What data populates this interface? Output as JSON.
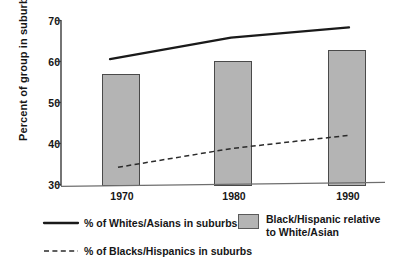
{
  "chart_data": {
    "type": "bar",
    "title": "",
    "subtitle": "",
    "xlabel": "",
    "ylabel": "Percent of group in suburbs",
    "categories": [
      "1970",
      "1980",
      "1990"
    ],
    "x_tick_labels": [
      "1970",
      "1980",
      "1990"
    ],
    "y_tick_labels": [
      "30",
      "40",
      "50",
      "60",
      "70"
    ],
    "y_ticks": [
      30,
      40,
      50,
      60,
      70
    ],
    "ylim": [
      30,
      70
    ],
    "grid": false,
    "legend_position": "below-axes",
    "series": [
      {
        "name": "Black/Hispanic relative to White/Asian",
        "render": "bar",
        "color": "#b4b4b4",
        "edge_color": "#4a4a4a",
        "values": [
          57.0,
          60.2,
          62.8
        ]
      },
      {
        "name": "% of Whites/Asians in suburbs",
        "render": "line-solid",
        "color": "#1a1a1a",
        "values": [
          60.6,
          65.8,
          68.3
        ]
      },
      {
        "name": "% of Blacks/Hispanics in suburbs",
        "render": "line-dashed",
        "color": "#2b2b2b",
        "values": [
          34.2,
          38.8,
          42.0
        ]
      }
    ]
  },
  "axes": {
    "y_axis_label": "Percent of group in suburbs",
    "y_tick_30": "30",
    "y_tick_40": "40",
    "y_tick_50": "50",
    "y_tick_60": "60",
    "y_tick_70": "70",
    "x_tick_1970": "1970",
    "x_tick_1980": "1980",
    "x_tick_1990": "1990"
  },
  "legend": {
    "solid_line_label": "% of Whites/Asians in suburbs",
    "dashed_line_label": "% of Blacks/Hispanics in suburbs",
    "swatch_label_line1": "Black/Hispanic relative",
    "swatch_label_line2": "to White/Asian",
    "swatch_color": "#b4b4b4"
  }
}
